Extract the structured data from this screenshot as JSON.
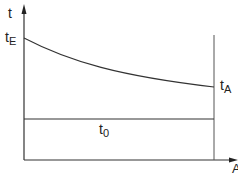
{
  "diagram": {
    "y_axis_label": "t",
    "x_axis_label": "A",
    "labels": {
      "t_E": {
        "main": "t",
        "sub": "E"
      },
      "t_A": {
        "main": "t",
        "sub": "A"
      },
      "t_0": {
        "main": "t",
        "sub": "0"
      }
    },
    "colors": {
      "line": "#333333",
      "background": "#ffffff"
    }
  }
}
